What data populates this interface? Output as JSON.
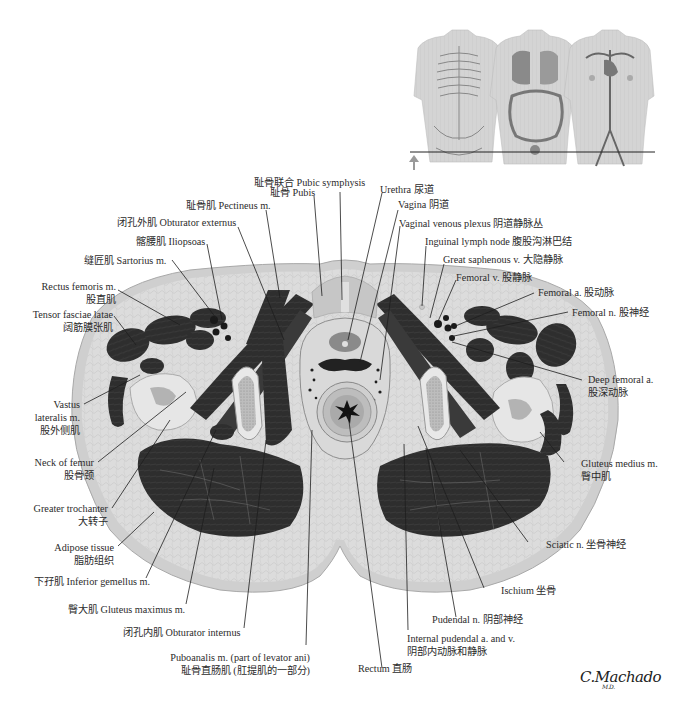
{
  "figure": {
    "signature": "C.Machado",
    "signature_suffix": "M.D.",
    "orientation_arrow": "up-arrow",
    "colors": {
      "muscle": "#2f2f2f",
      "fat": "#dedede",
      "skin": "#cfcfcf",
      "bone_marrow": "#b8b8b8",
      "bone_cortex": "#e8e8e8",
      "leader_line": "#1e1e1e",
      "label_text": "#2b2b2b"
    }
  },
  "inset": {
    "description": "Three torso views: skeleton, viscera, vasculature with horizontal section line",
    "panels": [
      "skeleton-torso",
      "viscera-torso",
      "vascular-torso"
    ]
  },
  "labels": {
    "pubic_symphysis": {
      "zh": "耻骨联合",
      "en": "Pubic symphysis"
    },
    "pubis": {
      "zh": "耻骨",
      "en": "Pubis"
    },
    "pectineus": {
      "zh": "耻骨肌",
      "en": "Pectineus m."
    },
    "obturator_externus": {
      "zh": "闭孔外肌",
      "en": "Obturator externus"
    },
    "iliopsoas": {
      "zh": "髂腰肌",
      "en": "Iliopsoas"
    },
    "sartorius": {
      "zh": "缝匠肌",
      "en": "Sartorius m."
    },
    "rectus_femoris": {
      "en": "Rectus femoris m.",
      "zh": "股直肌"
    },
    "tensor_fasciae_latae": {
      "en": "Tensor fasciae latae",
      "zh": "阔筋膜张肌"
    },
    "vastus_lateralis": {
      "en1": "Vastus",
      "en2": "lateralis m.",
      "zh": "股外侧肌"
    },
    "neck_of_femur": {
      "en": "Neck of femur",
      "zh": "股骨颈"
    },
    "greater_trochanter": {
      "en": "Greater trochanter",
      "zh": "大转子"
    },
    "adipose_tissue": {
      "en": "Adipose tissue",
      "zh": "脂肪组织"
    },
    "inferior_gemellus": {
      "zh": "下孖肌",
      "en": "Inferior gemellus m."
    },
    "gluteus_maximus": {
      "zh": "臀大肌",
      "en": "Gluteus maximus m."
    },
    "obturator_internus": {
      "zh": "闭孔内肌",
      "en": "Obturator internus"
    },
    "puboanalis": {
      "en": "Puboanalis m. (part of levator ani)",
      "zh": "耻骨直肠肌 (肛提肌的一部分)"
    },
    "rectum": {
      "en": "Rectum",
      "zh": "直肠"
    },
    "internal_pudendal": {
      "en": "Internal pudendal a. and v.",
      "zh": "阴部内动脉和静脉"
    },
    "pudendal_n": {
      "en": "Pudendal n.",
      "zh": "阴部神经"
    },
    "ischium": {
      "en": "Ischium",
      "zh": "坐骨"
    },
    "sciatic_n": {
      "en": "Sciatic n.",
      "zh": "坐骨神经"
    },
    "gluteus_medius": {
      "en": "Gluteus medius m.",
      "zh": "臀中肌"
    },
    "deep_femoral_a": {
      "en": "Deep femoral a.",
      "zh": "股深动脉"
    },
    "femoral_n": {
      "en": "Femoral n.",
      "zh": "股神经"
    },
    "femoral_a": {
      "en": "Femoral a.",
      "zh": "股动脉"
    },
    "femoral_v": {
      "en": "Femoral v.",
      "zh": "股静脉"
    },
    "great_saphenous_v": {
      "en": "Great saphenous v.",
      "zh": "大隐静脉"
    },
    "inguinal_lymph_node": {
      "en": "Inguinal lymph node",
      "zh": "腹股沟淋巴结"
    },
    "vaginal_venous_plexus": {
      "en": "Vaginal venous plexus",
      "zh": "阴道静脉丛"
    },
    "vagina": {
      "en": "Vagina",
      "zh": "阴道"
    },
    "urethra": {
      "en": "Urethra",
      "zh": "尿道"
    }
  }
}
